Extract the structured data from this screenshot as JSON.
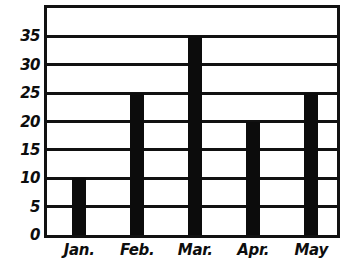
{
  "chart_data": {
    "type": "bar",
    "title": "",
    "subtitle": "",
    "xlabel": "",
    "ylabel": "",
    "categories": [
      "Jan.",
      "Feb.",
      "Mar.",
      "Apr.",
      "May"
    ],
    "values": [
      10,
      25,
      35,
      20,
      25
    ],
    "ylim": [
      0,
      40
    ],
    "yticks": [
      0,
      5,
      10,
      15,
      20,
      25,
      30,
      35
    ],
    "ytick_labels": [
      "0",
      "5",
      "10",
      "15",
      "20",
      "25",
      "30",
      "35"
    ],
    "grid": "horizontal",
    "legend": "none",
    "bar_color": "#0c0c0c",
    "axis_color": "#111111",
    "background_color": "#ffffff",
    "style": "hand-drawn"
  },
  "axes": {
    "y": {
      "ticks": [
        {
          "value": 35,
          "label": "35"
        },
        {
          "value": 30,
          "label": "30"
        },
        {
          "value": 25,
          "label": "25"
        },
        {
          "value": 20,
          "label": "20"
        },
        {
          "value": 15,
          "label": "15"
        },
        {
          "value": 10,
          "label": "10"
        },
        {
          "value": 5,
          "label": "5"
        },
        {
          "value": 0,
          "label": "0"
        }
      ]
    },
    "x": {
      "ticks": [
        {
          "label": "Jan."
        },
        {
          "label": "Feb."
        },
        {
          "label": "Mar."
        },
        {
          "label": "Apr."
        },
        {
          "label": "May"
        }
      ]
    }
  },
  "bars": [
    {
      "category": "Jan.",
      "value": 10
    },
    {
      "category": "Feb.",
      "value": 25
    },
    {
      "category": "Mar.",
      "value": 35
    },
    {
      "category": "Apr.",
      "value": 20
    },
    {
      "category": "May",
      "value": 25
    }
  ]
}
